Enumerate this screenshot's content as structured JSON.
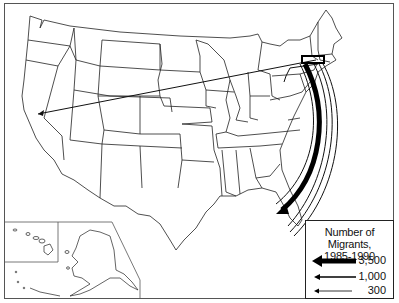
{
  "map": {
    "subject": "Interstate migration flows from the Northeast",
    "regions_shown": [
      "Contiguous United States",
      "Alaska inset",
      "Hawaii inset"
    ],
    "flows": [
      {
        "from": "New York / New England",
        "to": "Florida",
        "magnitude_class": "largest",
        "style": "thick black arrow"
      },
      {
        "from": "New York / New England",
        "to": "Florida (outer)",
        "magnitude_class": "medium",
        "style": "outlined arrow"
      },
      {
        "from": "New York / New England",
        "to": "California",
        "magnitude_class": "small",
        "style": "thin line arrow"
      },
      {
        "from": "New England",
        "to": "Pennsylvania/New Jersey",
        "magnitude_class": "small",
        "style": "thin line arrow"
      }
    ],
    "colors": {
      "ink": "#111111",
      "background": "#ffffff",
      "border": "#555555"
    }
  },
  "legend": {
    "title_line1": "Number of Migrants,",
    "title_line2": "1985-1990",
    "entries": [
      {
        "label": "3,500",
        "weight": "thick"
      },
      {
        "label": "1,000",
        "weight": "medium"
      },
      {
        "label": "300",
        "weight": "thin"
      }
    ]
  }
}
